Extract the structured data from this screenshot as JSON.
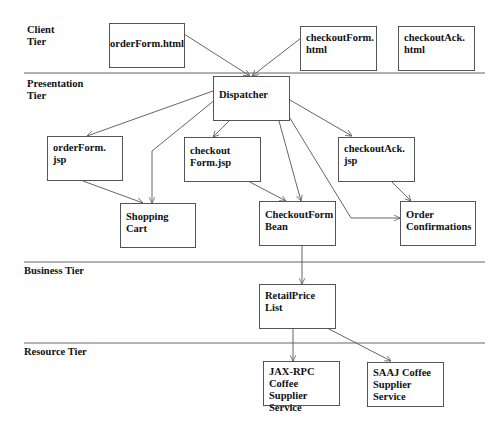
{
  "tiers": [
    {
      "id": "client",
      "label": "Client\nTier"
    },
    {
      "id": "presentation",
      "label": "Presentation\nTier"
    },
    {
      "id": "business",
      "label": "Business Tier"
    },
    {
      "id": "resource",
      "label": "Resource Tier"
    }
  ],
  "nodes": {
    "orderForm_html": "orderForm.html",
    "checkoutForm_html": "checkoutForm.\nhtml",
    "checkoutAck_html": "checkoutAck.\nhtml",
    "dispatcher": "Dispatcher",
    "orderForm_jsp": "orderForm.\njsp",
    "checkoutForm_jsp": "checkout\nForm.jsp",
    "checkoutAck_jsp": "checkoutAck.\njsp",
    "shopping_cart": "Shopping\nCart",
    "checkoutForm_bean": "CheckoutForm\nBean",
    "order_confirmations": "Order\nConfirmations",
    "retailPrice_list": "RetailPrice\nList",
    "jaxrpc_service": "JAX-RPC\nCoffee Supplier\nService",
    "saaj_service": "SAAJ Coffee\nSupplier\nService"
  },
  "edges": [
    {
      "from": "orderForm.html",
      "to": "Dispatcher"
    },
    {
      "from": "checkoutForm.html",
      "to": "Dispatcher"
    },
    {
      "from": "Dispatcher",
      "to": "orderForm.jsp"
    },
    {
      "from": "Dispatcher",
      "to": "Shopping Cart"
    },
    {
      "from": "Dispatcher",
      "to": "checkoutForm.jsp"
    },
    {
      "from": "Dispatcher",
      "to": "CheckoutForm Bean"
    },
    {
      "from": "Dispatcher",
      "to": "Order Confirmations"
    },
    {
      "from": "Dispatcher",
      "to": "checkoutAck.jsp"
    },
    {
      "from": "orderForm.jsp",
      "to": "Shopping Cart"
    },
    {
      "from": "checkoutForm.jsp",
      "to": "CheckoutForm Bean"
    },
    {
      "from": "checkoutAck.jsp",
      "to": "Order Confirmations"
    },
    {
      "from": "CheckoutForm Bean",
      "to": "RetailPrice List"
    },
    {
      "from": "RetailPrice List",
      "to": "JAX-RPC Coffee Supplier Service"
    },
    {
      "from": "RetailPrice List",
      "to": "SAAJ Coffee Supplier Service"
    }
  ],
  "colors": {
    "line": "#555555",
    "text": "#111111",
    "background": "#ffffff"
  }
}
